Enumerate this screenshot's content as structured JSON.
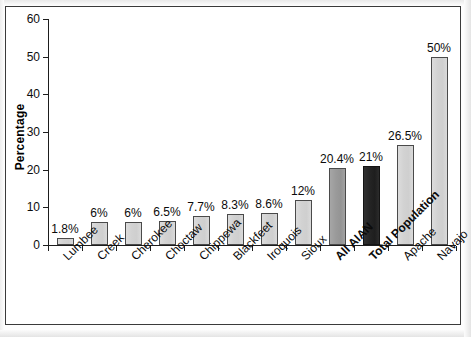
{
  "chart_data": {
    "type": "bar",
    "title": "",
    "xlabel": "",
    "ylabel": "Percentage",
    "ylim": [
      0,
      60
    ],
    "ytick_step": 10,
    "yticks": [
      "60",
      "50",
      "40",
      "30",
      "20",
      "10",
      "0"
    ],
    "grid": false,
    "legend": "none",
    "value_suffix": "%",
    "categories": [
      "Lumbee",
      "Creek",
      "Cherokee",
      "Choctaw",
      "Chippewa",
      "Blackfeet",
      "Iroquois",
      "Sioux",
      "All AIAN",
      "Total Population",
      "Apache",
      "Navajo"
    ],
    "values": [
      1.8,
      6,
      6,
      6.5,
      7.7,
      8.3,
      8.6,
      12,
      20.4,
      21,
      26.5,
      50
    ],
    "value_labels": [
      "1.8%",
      "6%",
      "6%",
      "6.5%",
      "7.7%",
      "8.3%",
      "8.6%",
      "12%",
      "20.4%",
      "21%",
      "26.5%",
      "50%"
    ],
    "bar_styles": [
      "light",
      "light",
      "light",
      "light",
      "light",
      "light",
      "light",
      "light",
      "medium",
      "dark",
      "light",
      "light"
    ],
    "emphasized_categories": [
      "All AIAN",
      "Total Population"
    ],
    "colors": {
      "bar_light": "#d2d2d2",
      "bar_medium": "#9a9a9a",
      "bar_dark": "#242424",
      "bar_border": "#4a4a4a",
      "axis": "#1d1d1d",
      "text": "#0b0b0b",
      "frame_border": "#3a3a3a",
      "background": "#ffffff"
    }
  }
}
